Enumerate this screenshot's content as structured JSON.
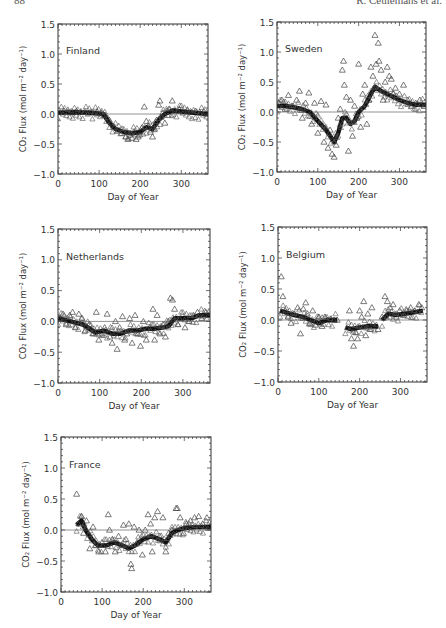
{
  "header": {
    "page_number": "88",
    "author": "R. Ceulemans et al."
  },
  "chart_data": [
    {
      "type": "scatter",
      "title": "Finland",
      "xlabel": "Day of Year",
      "ylabel": "CO₂ Flux (mol m⁻² day⁻¹)",
      "xlim": [
        0,
        365
      ],
      "ylim": [
        -1.0,
        1.5
      ],
      "xticks": [
        0,
        100,
        200,
        300
      ],
      "yticks": [
        -1.0,
        -0.5,
        0.0,
        0.5,
        1.0,
        1.5
      ],
      "ytick_labels": [
        "−1.0",
        "−0.5",
        "0.0",
        "0.5",
        "1.0",
        "1.5"
      ],
      "zero_line": true,
      "frame": {
        "x": 58,
        "y": 24,
        "w": 150,
        "h": 150
      },
      "series": [
        {
          "name": "daily flux (triangles)",
          "marker": "triangle",
          "x": [
            5,
            15,
            25,
            35,
            45,
            55,
            65,
            75,
            85,
            95,
            105,
            115,
            125,
            135,
            145,
            155,
            165,
            170,
            175,
            180,
            185,
            190,
            195,
            200,
            205,
            210,
            215,
            220,
            225,
            230,
            235,
            240,
            245,
            248,
            250,
            255,
            260,
            265,
            270,
            278,
            285,
            295,
            305,
            315,
            325,
            335,
            345,
            355,
            362
          ],
          "y": [
            0.03,
            0.05,
            0.04,
            0.02,
            0.05,
            0.03,
            0.04,
            0.02,
            0.03,
            0.04,
            0.02,
            -0.02,
            -0.1,
            -0.2,
            -0.28,
            -0.32,
            -0.38,
            -0.42,
            -0.35,
            -0.4,
            -0.3,
            -0.42,
            -0.38,
            -0.3,
            -0.22,
            0.12,
            -0.12,
            -0.2,
            -0.3,
            -0.38,
            -0.25,
            -0.1,
            0.15,
            0.22,
            -0.05,
            0.02,
            -0.15,
            0.05,
            0.08,
            0.22,
            0.05,
            0.08,
            0.04,
            0.06,
            0.03,
            0.05,
            0.03,
            0.04,
            0.0
          ]
        },
        {
          "name": "running mean (line)",
          "marker": "thick-line",
          "x": [
            0,
            40,
            80,
            110,
            125,
            140,
            160,
            180,
            200,
            215,
            230,
            245,
            260,
            280,
            300,
            330,
            365
          ],
          "y": [
            0.02,
            0.03,
            0.02,
            0.0,
            -0.15,
            -0.25,
            -0.3,
            -0.32,
            -0.3,
            -0.22,
            -0.25,
            -0.1,
            0.0,
            0.06,
            0.04,
            0.02,
            0.0
          ]
        }
      ]
    },
    {
      "type": "scatter",
      "title": "Sweden",
      "xlabel": "Day of Year",
      "ylabel": "CO₂ Flux (mol m⁻² day⁻¹)",
      "xlim": [
        0,
        365
      ],
      "ylim": [
        -1.0,
        1.5
      ],
      "xticks": [
        0,
        100,
        200,
        300
      ],
      "yticks": [
        -1.0,
        -0.5,
        0.0,
        0.5,
        1.0,
        1.5
      ],
      "ytick_labels": [
        "−1.0",
        "−0.5",
        "0.0",
        "0.5",
        "1.0",
        "1.5"
      ],
      "zero_line": true,
      "frame": {
        "x": 277,
        "y": 22,
        "w": 149,
        "h": 150
      },
      "series": [
        {
          "name": "daily flux (triangles)",
          "marker": "triangle",
          "x": [
            5,
            12,
            20,
            28,
            38,
            48,
            55,
            62,
            70,
            78,
            85,
            92,
            100,
            108,
            115,
            120,
            125,
            130,
            135,
            140,
            145,
            150,
            155,
            160,
            163,
            165,
            170,
            175,
            180,
            185,
            190,
            195,
            200,
            205,
            210,
            215,
            220,
            225,
            230,
            235,
            240,
            243,
            248,
            250,
            255,
            260,
            265,
            270,
            275,
            280,
            285,
            290,
            300,
            310,
            320,
            330,
            340,
            350,
            360
          ],
          "y": [
            0.15,
            0.2,
            0.05,
            0.28,
            0.1,
            0.2,
            0.35,
            -0.1,
            0.15,
            0.32,
            -0.2,
            0.15,
            -0.35,
            0.18,
            -0.5,
            0.12,
            -0.6,
            -0.3,
            -0.7,
            -0.75,
            -0.55,
            -0.1,
            0.05,
            0.7,
            0.85,
            0.45,
            0.25,
            -0.65,
            0.2,
            -0.4,
            0.1,
            -0.1,
            0.8,
            -0.25,
            0.3,
            0.45,
            -0.2,
            0.2,
            0.75,
            0.6,
            1.28,
            0.8,
            1.15,
            0.85,
            0.7,
            0.2,
            0.5,
            0.75,
            0.6,
            0.55,
            0.3,
            0.4,
            0.3,
            0.45,
            0.2,
            0.1,
            0.15,
            0.2,
            0.1
          ]
        },
        {
          "name": "running mean (line)",
          "marker": "thick-line",
          "x": [
            0,
            20,
            40,
            60,
            80,
            100,
            120,
            140,
            150,
            160,
            170,
            180,
            190,
            200,
            215,
            230,
            240,
            255,
            270,
            285,
            300,
            320,
            340,
            365
          ],
          "y": [
            0.1,
            0.1,
            0.08,
            0.05,
            0.0,
            -0.15,
            -0.3,
            -0.5,
            -0.35,
            -0.1,
            -0.1,
            -0.2,
            -0.15,
            0.0,
            0.1,
            0.3,
            0.42,
            0.35,
            0.3,
            0.25,
            0.2,
            0.15,
            0.12,
            0.12
          ]
        }
      ]
    },
    {
      "type": "scatter",
      "title": "Netherlands",
      "xlabel": "Day of Year",
      "ylabel": "CO₂ Flux (mol m⁻² day⁻¹)",
      "xlim": [
        0,
        365
      ],
      "ylim": [
        -1.0,
        1.5
      ],
      "xticks": [
        0,
        100,
        200,
        300
      ],
      "yticks": [
        -1.0,
        -0.5,
        0.0,
        0.5,
        1.0,
        1.5
      ],
      "ytick_labels": [
        "−1.0",
        "−0.5",
        "0.0",
        "0.5",
        "1.0",
        "1.5"
      ],
      "zero_line": true,
      "frame": {
        "x": 58,
        "y": 229,
        "w": 152,
        "h": 154
      },
      "series": [
        {
          "name": "daily flux (triangles)",
          "marker": "triangle",
          "x": [
            5,
            12,
            20,
            28,
            35,
            42,
            50,
            58,
            65,
            75,
            85,
            92,
            98,
            105,
            112,
            118,
            125,
            130,
            138,
            142,
            148,
            155,
            160,
            165,
            172,
            178,
            185,
            192,
            198,
            205,
            212,
            220,
            228,
            232,
            238,
            245,
            252,
            258,
            265,
            270,
            275,
            280,
            288,
            295,
            305,
            315,
            325,
            335,
            345,
            355,
            362
          ],
          "y": [
            0.05,
            0.12,
            -0.05,
            0.1,
            0.15,
            -0.1,
            0.12,
            0.05,
            -0.15,
            -0.05,
            -0.2,
            0.15,
            -0.3,
            -0.2,
            -0.1,
            0.12,
            -0.25,
            -0.35,
            0.0,
            -0.45,
            -0.1,
            0.08,
            -0.3,
            -0.2,
            0.05,
            -0.35,
            0.1,
            -0.2,
            -0.4,
            0.0,
            -0.3,
            -0.1,
            0.2,
            -0.3,
            0.1,
            -0.2,
            -0.05,
            -0.25,
            0.0,
            0.38,
            0.35,
            0.2,
            -0.05,
            0.05,
            -0.1,
            0.0,
            0.1,
            0.15,
            0.05,
            0.15,
            0.1
          ]
        },
        {
          "name": "running mean (line)",
          "marker": "thick-line",
          "x": [
            0,
            30,
            60,
            90,
            110,
            130,
            150,
            170,
            190,
            210,
            230,
            250,
            265,
            280,
            300,
            320,
            340,
            365
          ],
          "y": [
            0.05,
            0.0,
            -0.05,
            -0.18,
            -0.15,
            -0.2,
            -0.2,
            -0.15,
            -0.15,
            -0.12,
            -0.12,
            -0.1,
            -0.08,
            0.05,
            0.05,
            0.05,
            0.1,
            0.1
          ]
        }
      ]
    },
    {
      "type": "scatter",
      "title": "Belgium",
      "xlabel": "Day of Year",
      "ylabel": "CO₂ Flux (mol m⁻² day⁻¹)",
      "xlim": [
        0,
        365
      ],
      "ylim": [
        -1.0,
        1.5
      ],
      "xticks": [
        0,
        100,
        200,
        300
      ],
      "yticks": [
        -1.0,
        -0.5,
        0.0,
        0.5,
        1.0,
        1.5
      ],
      "ytick_labels": [
        "−1.0",
        "−0.5",
        "0.0",
        "0.5",
        "1.0",
        "1.5"
      ],
      "zero_line": true,
      "frame": {
        "x": 278,
        "y": 227,
        "w": 149,
        "h": 155
      },
      "series": [
        {
          "name": "daily flux (triangles)",
          "marker": "triangle",
          "x": [
            8,
            12,
            18,
            25,
            32,
            40,
            48,
            55,
            62,
            68,
            72,
            78,
            85,
            92,
            100,
            108,
            115,
            122,
            130,
            138,
            145,
            175,
            180,
            185,
            190,
            195,
            200,
            205,
            210,
            215,
            220,
            225,
            230,
            238,
            245,
            255,
            262,
            268,
            275,
            282,
            290,
            298,
            305,
            315,
            325,
            335,
            345,
            352
          ],
          "y": [
            0.7,
            0.38,
            0.15,
            0.05,
            -0.05,
            0.1,
            0.2,
            -0.22,
            0.18,
            0.28,
            0.1,
            -0.05,
            0.15,
            -0.08,
            0.05,
            -0.1,
            0.05,
            0.0,
            0.02,
            0.0,
            0.0,
            0.15,
            -0.3,
            -0.42,
            -0.2,
            -0.3,
            0.15,
            0.05,
            0.3,
            -0.25,
            0.1,
            -0.15,
            0.2,
            -0.1,
            -0.15,
            0.05,
            0.38,
            0.3,
            0.2,
            0.25,
            0.05,
            0.15,
            0.1,
            0.15,
            0.2,
            0.15,
            0.25,
            0.2
          ]
        },
        {
          "name": "running mean (line)",
          "marker": "thick-line",
          "segments": [
            {
              "x": [
                5,
                20,
                40,
                60,
                80,
                100,
                120,
                145
              ],
              "y": [
                0.15,
                0.12,
                0.08,
                0.05,
                0.0,
                -0.05,
                0.0,
                0.0
              ]
            },
            {
              "x": [
                165,
                180,
                200,
                220,
                245
              ],
              "y": [
                -0.12,
                -0.15,
                -0.12,
                -0.1,
                -0.1
              ]
            },
            {
              "x": [
                255,
                270,
                290,
                310,
                330,
                355
              ],
              "y": [
                0.0,
                0.1,
                0.08,
                0.1,
                0.12,
                0.15
              ]
            }
          ]
        }
      ]
    },
    {
      "type": "scatter",
      "title": "France",
      "xlabel": "Day of Year",
      "ylabel": "CO₂ Flux (mol m⁻² day⁻¹)",
      "xlim": [
        0,
        365
      ],
      "ylim": [
        -1.0,
        1.5
      ],
      "xticks": [
        0,
        100,
        200,
        300
      ],
      "yticks": [
        -1.0,
        -0.5,
        0.0,
        0.5,
        1.0,
        1.5
      ],
      "ytick_labels": [
        "−1.0",
        "−0.5",
        "0.0",
        "0.5",
        "1.0",
        "1.5"
      ],
      "zero_line": true,
      "frame": {
        "x": 61,
        "y": 437,
        "w": 150,
        "h": 155
      },
      "series": [
        {
          "name": "daily flux (triangles)",
          "marker": "triangle",
          "x": [
            38,
            44,
            50,
            55,
            62,
            70,
            78,
            85,
            92,
            100,
            108,
            115,
            118,
            125,
            132,
            140,
            148,
            152,
            158,
            165,
            170,
            172,
            178,
            185,
            190,
            198,
            205,
            212,
            218,
            222,
            228,
            235,
            240,
            248,
            255,
            262,
            270,
            280,
            283,
            290,
            298,
            305,
            315,
            325,
            335,
            345,
            355,
            362
          ],
          "y": [
            0.58,
            0.1,
            0.22,
            -0.05,
            0.15,
            -0.3,
            0.05,
            -0.25,
            -0.35,
            -0.2,
            -0.35,
            0.25,
            0.0,
            -0.15,
            -0.35,
            -0.1,
            -0.25,
            0.08,
            -0.15,
            0.1,
            -0.55,
            -0.62,
            0.05,
            -0.2,
            0.0,
            -0.4,
            0.0,
            0.25,
            0.1,
            -0.35,
            0.2,
            0.3,
            -0.1,
            0.2,
            -0.35,
            -0.05,
            0.0,
            0.35,
            0.35,
            0.2,
            -0.05,
            0.1,
            0.15,
            0.2,
            0.22,
            0.1,
            0.2,
            0.05
          ]
        },
        {
          "name": "running mean (line)",
          "marker": "thick-line",
          "x": [
            38,
            50,
            60,
            75,
            90,
            110,
            130,
            150,
            165,
            180,
            200,
            220,
            240,
            255,
            270,
            285,
            300,
            330,
            365
          ],
          "y": [
            0.08,
            0.15,
            0.0,
            -0.15,
            -0.25,
            -0.25,
            -0.2,
            -0.25,
            -0.3,
            -0.25,
            -0.15,
            -0.1,
            -0.15,
            -0.2,
            -0.05,
            0.0,
            0.03,
            0.05,
            0.05
          ]
        }
      ]
    }
  ]
}
